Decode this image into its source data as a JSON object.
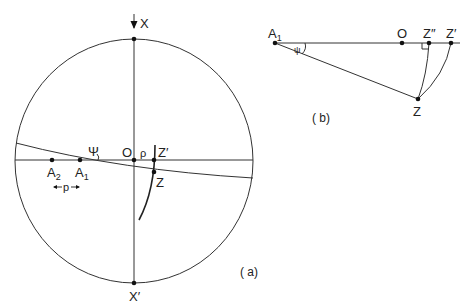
{
  "figure": {
    "panel_a": {
      "label": "( a)",
      "labels": {
        "X": "X",
        "X_prime": "X′",
        "O": "O",
        "rho": "ρ",
        "Z_prime": "Z′",
        "Z": "Z",
        "A1": "A",
        "A1_sub": "1",
        "A2": "A",
        "A2_sub": "2",
        "psi": "Ψ",
        "p_left": "←",
        "p": "p",
        "p_right": "→"
      }
    },
    "panel_b": {
      "label": "( b)",
      "labels": {
        "A1": "A",
        "A1_sub": "1",
        "O": "O",
        "Z_double_prime": "Z″",
        "Z_prime": "Z′",
        "Z": "Z",
        "psi": "ψ"
      }
    }
  }
}
